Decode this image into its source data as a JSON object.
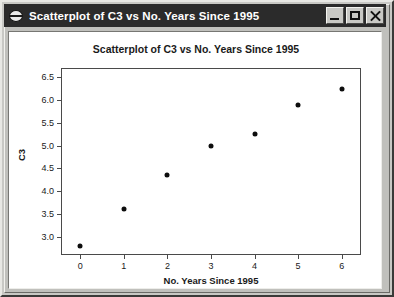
{
  "window": {
    "title": "Scatterplot of C3 vs No. Years Since 1995",
    "icon": "minitab-disc-icon",
    "buttons": {
      "minimize": "Minimize",
      "maximize": "Maximize",
      "close": "Close"
    }
  },
  "chart_data": {
    "type": "scatter",
    "title": "Scatterplot of C3 vs No. Years Since 1995",
    "xlabel": "No. Years Since 1995",
    "ylabel": "C3",
    "x": [
      0,
      1,
      2,
      3,
      4,
      5,
      6
    ],
    "y": [
      2.8,
      3.6,
      4.35,
      5.0,
      5.25,
      5.9,
      6.25
    ],
    "xticks": [
      "0",
      "1",
      "2",
      "3",
      "4",
      "5",
      "6"
    ],
    "ytick_values": [
      3.0,
      3.5,
      4.0,
      4.5,
      5.0,
      5.5,
      6.0,
      6.5
    ],
    "yticks": [
      "3.0",
      "3.5",
      "4.0",
      "4.5",
      "5.0",
      "5.5",
      "6.0",
      "6.5"
    ],
    "xlim": [
      -0.42,
      6.42
    ],
    "ylim": [
      2.62,
      6.68
    ],
    "grid": false,
    "legend": null,
    "marker": "filled-circle",
    "marker_color": "#0d0d0d"
  },
  "colors": {
    "titlebar_bg": "#2b2b2b",
    "titlebar_text": "#ffffff",
    "window_bg": "#c0c0bc",
    "plot_bg": "#ffffff",
    "axis": "#4a4a4a"
  }
}
